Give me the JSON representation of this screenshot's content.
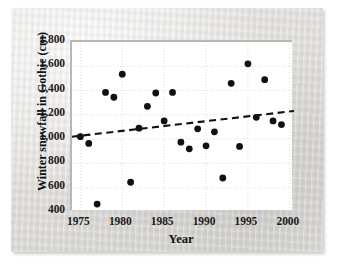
{
  "chart_data": {
    "type": "scatter",
    "title": "",
    "xlabel": "Year",
    "ylabel": "Winter snowfall in Gothic (cm)",
    "xlim": [
      1974,
      2000.5
    ],
    "ylim": [
      400,
      1800
    ],
    "xticks": [
      "1975",
      "1980",
      "1985",
      "1990",
      "1995",
      "2000"
    ],
    "xtick_values": [
      1975,
      1980,
      1985,
      1990,
      1995,
      2000
    ],
    "yticks": [
      "400",
      "600",
      "800",
      "1,000",
      "1,200",
      "1,400",
      "1,600",
      "1,800"
    ],
    "ytick_values": [
      400,
      600,
      800,
      1000,
      1200,
      1400,
      1600,
      1800
    ],
    "grid": true,
    "legend": "none",
    "marker": "filled-circle",
    "marker_color": "#111111",
    "x": [
      1975,
      1976,
      1977,
      1978,
      1979,
      1980,
      1981,
      1982,
      1983,
      1984,
      1985,
      1986,
      1987,
      1988,
      1989,
      1990,
      1991,
      1992,
      1993,
      1994,
      1995,
      1996,
      1997,
      1998,
      1999
    ],
    "y": [
      1020,
      965,
      465,
      1385,
      1345,
      1535,
      645,
      1090,
      1270,
      1380,
      1150,
      1385,
      975,
      920,
      1085,
      945,
      1060,
      680,
      1460,
      940,
      1620,
      1180,
      1490,
      1150,
      1120
    ],
    "series": [
      {
        "name": "Winter snowfall in Gothic",
        "points": [
          {
            "x": 1975,
            "y": 1020
          },
          {
            "x": 1976,
            "y": 965
          },
          {
            "x": 1977,
            "y": 465
          },
          {
            "x": 1978,
            "y": 1385
          },
          {
            "x": 1979,
            "y": 1345
          },
          {
            "x": 1980,
            "y": 1535
          },
          {
            "x": 1981,
            "y": 645
          },
          {
            "x": 1982,
            "y": 1090
          },
          {
            "x": 1983,
            "y": 1270
          },
          {
            "x": 1984,
            "y": 1380
          },
          {
            "x": 1985,
            "y": 1150
          },
          {
            "x": 1986,
            "y": 1385
          },
          {
            "x": 1987,
            "y": 975
          },
          {
            "x": 1988,
            "y": 920
          },
          {
            "x": 1989,
            "y": 1085
          },
          {
            "x": 1990,
            "y": 945
          },
          {
            "x": 1991,
            "y": 1060
          },
          {
            "x": 1992,
            "y": 680
          },
          {
            "x": 1993,
            "y": 1460
          },
          {
            "x": 1994,
            "y": 940
          },
          {
            "x": 1995,
            "y": 1620
          },
          {
            "x": 1996,
            "y": 1180
          },
          {
            "x": 1997,
            "y": 1490
          },
          {
            "x": 1998,
            "y": 1150
          },
          {
            "x": 1999,
            "y": 1120
          }
        ]
      }
    ],
    "trendline": {
      "style": "dashed",
      "color": "#111111",
      "x_start": 1974,
      "y_start": 1020,
      "x_end": 2000.5,
      "y_end": 1232
    }
  }
}
